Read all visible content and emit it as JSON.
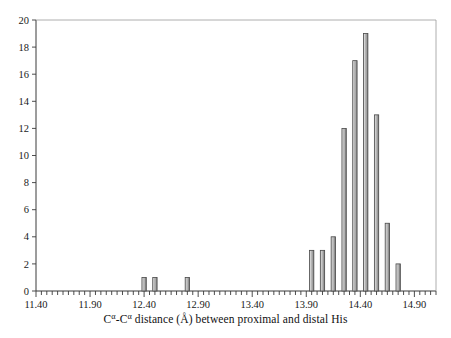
{
  "chart_data": {
    "type": "bar",
    "title": "",
    "subtitle": "",
    "xlabel": "Cα-Cα distance (Å) between proximal and distal His",
    "xlabel_parts": {
      "c1": "C",
      "alpha1": "α",
      "dash": "-",
      "c2": "C",
      "alpha2": "α",
      "rest": " distance (Å) between proximal and distal His"
    },
    "ylabel": "",
    "xlim": [
      11.4,
      15.1
    ],
    "ylim": [
      0,
      20
    ],
    "xtick_major_step": 0.5,
    "xtick_minor_step": 0.05,
    "ytick_step": 2,
    "grid": false,
    "legend": null,
    "bin_width": 0.05,
    "xticklabels": [
      "11.40",
      "11.90",
      "12.40",
      "12.90",
      "13.40",
      "13.90",
      "14.40",
      "14.90"
    ],
    "xticklabel_values": [
      11.4,
      11.9,
      12.4,
      12.9,
      13.4,
      13.9,
      14.4,
      14.9
    ],
    "yticklabels": [
      "0",
      "2",
      "4",
      "6",
      "8",
      "10",
      "12",
      "14",
      "16",
      "18",
      "20"
    ],
    "yticklabel_values": [
      0,
      2,
      4,
      6,
      8,
      10,
      12,
      14,
      16,
      18,
      20
    ],
    "x": [
      12.4,
      12.5,
      12.8,
      13.95,
      14.05,
      14.15,
      14.25,
      14.35,
      14.45,
      14.55,
      14.65,
      14.75
    ],
    "values": [
      1,
      1,
      1,
      3,
      3,
      4,
      12,
      17,
      19,
      13,
      5,
      2
    ],
    "bars": [
      {
        "x": 12.4,
        "value": 1
      },
      {
        "x": 12.5,
        "value": 1
      },
      {
        "x": 12.8,
        "value": 1
      },
      {
        "x": 13.95,
        "value": 3
      },
      {
        "x": 14.05,
        "value": 3
      },
      {
        "x": 14.15,
        "value": 4
      },
      {
        "x": 14.25,
        "value": 12
      },
      {
        "x": 14.35,
        "value": 17
      },
      {
        "x": 14.45,
        "value": 19
      },
      {
        "x": 14.55,
        "value": 13
      },
      {
        "x": 14.65,
        "value": 5
      },
      {
        "x": 14.75,
        "value": 2
      }
    ],
    "colors": {
      "bar_fill": "#b4b4b4",
      "bar_edge": "#4a4a4a",
      "axis": "#3a3a3a",
      "frame": "#9a9a9a",
      "text": "#1a1a1a",
      "background": "#ffffff"
    }
  }
}
